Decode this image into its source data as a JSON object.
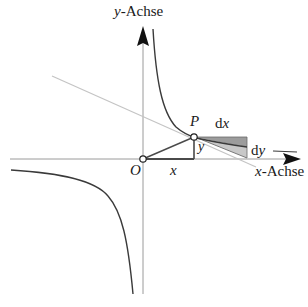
{
  "diagram": {
    "type": "hyperbola-tangent-differential",
    "labels": {
      "y_axis_var": "y",
      "y_axis_suffix": "-Achse",
      "x_axis_var": "x",
      "x_axis_suffix": "-Achse",
      "origin": "O",
      "point": "P",
      "x_segment": "x",
      "y_segment": "y",
      "dx_d": "d",
      "dx_var": "x",
      "dy_d": "d",
      "dy_var": "y"
    },
    "colors": {
      "axis": "#9a9a9a",
      "curve": "#3a3a3a",
      "tangent": "#c4c4c4",
      "shade_dark": "#9c9c9c",
      "shade_light": "#c8c8c8",
      "triangle": "#4a4a4a",
      "text": "#1a1a1a"
    },
    "points": {
      "origin": [
        143,
        159
      ],
      "P": [
        194,
        137
      ]
    }
  }
}
